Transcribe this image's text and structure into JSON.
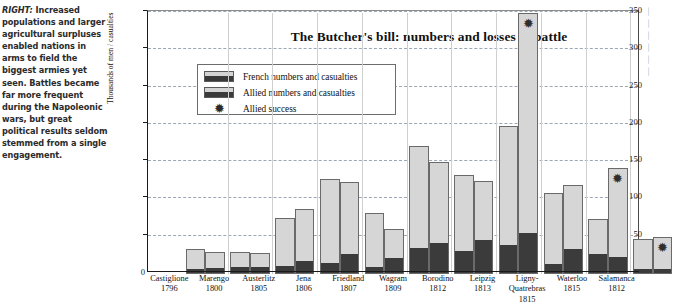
{
  "caption": {
    "lead": "RIGHT:",
    "text": " Increased populations and larger agricultural surpluses enabled nations in arms to field the biggest armies yet seen. Battles became far more frequent during the Napoleonic wars, but great political results seldom stemmed from a single engagement."
  },
  "legend": {
    "french_label": "French numbers and casualties",
    "allied_label": "Allied numbers and casualties",
    "success_label": "Allied success",
    "star_glyph": "✹"
  },
  "axis": {
    "zero_label": "0",
    "ylabel": "Thousands of men / casualties",
    "yticks": [
      "50",
      "100",
      "150",
      "200",
      "250",
      "300",
      "350"
    ]
  },
  "colors": {
    "bar_fill": "#d6d6d6",
    "casualty_fill": "#3b3b3b",
    "bar_border": "#6a6a6a",
    "gridline": "#9aa7b4",
    "axis": "#1a1a1a",
    "text": "#111111"
  },
  "chart_data": {
    "type": "bar",
    "title": "The Butcher's bill:  numbers and losses in battle",
    "xlabel": "",
    "ylabel": "Thousands of men / casualties",
    "ylim": [
      0,
      350
    ],
    "ytick_step": 50,
    "grid": true,
    "legend_position": "upper-left-inside",
    "categories": [
      "Castiglione",
      "Marengo",
      "Austerlitz",
      "Jena",
      "Friedland",
      "Wagram",
      "Borodino",
      "Leipzig",
      "Ligny-Quatrebras",
      "Waterloo",
      "Salamanca"
    ],
    "years": [
      "1796",
      "1800",
      "1805",
      "1806",
      "1807",
      "1809",
      "1812",
      "1813",
      "1815",
      "1815",
      "1812"
    ],
    "series": [
      {
        "name": "French numbers and casualties",
        "numbers": [
          33,
          30,
          75,
          128,
          82,
          172,
          133,
          198,
          108,
          74,
          47
        ],
        "casualties": [
          6,
          8,
          9,
          13,
          8,
          33,
          30,
          38,
          12,
          25,
          5
        ]
      },
      {
        "name": "Allied numbers and casualties",
        "numbers": [
          30,
          28,
          87,
          123,
          60,
          150,
          125,
          350,
          120,
          142,
          50
        ],
        "casualties": [
          7,
          8,
          16,
          26,
          20,
          40,
          44,
          54,
          32,
          22,
          6
        ]
      }
    ],
    "annotations": [
      {
        "label": "Allied success",
        "marker": "✹",
        "categories": [
          "Leipzig",
          "Waterloo",
          "Salamanca"
        ]
      }
    ]
  },
  "right_column": {
    "fragments": [
      "⎸",
      "⎸",
      "⎸",
      "⎸",
      "⎸",
      "⎸"
    ]
  }
}
